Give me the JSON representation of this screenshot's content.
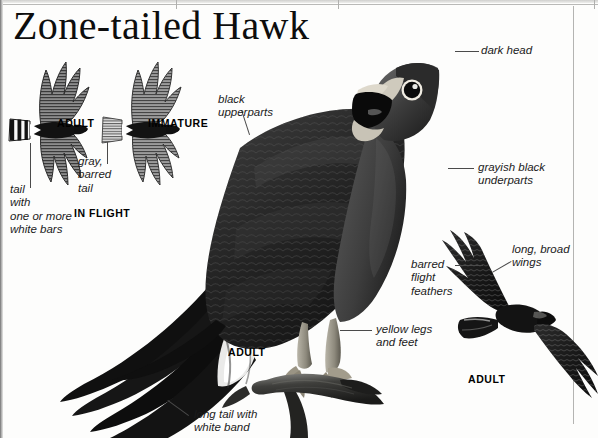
{
  "page": {
    "title": "Zone-tailed Hawk",
    "width": 598,
    "height": 438,
    "background": "#fdfdfc",
    "ink": "#111111"
  },
  "plate": {
    "subject": "Zone-tailed Hawk",
    "figures": [
      {
        "name": "adult-in-flight-silhouette",
        "caption": "ADULT"
      },
      {
        "name": "immature-in-flight-silhouette",
        "caption": "IMMATURE"
      },
      {
        "name": "in-flight-group",
        "caption": "IN FLIGHT"
      },
      {
        "name": "perched-adult",
        "caption": "ADULT"
      },
      {
        "name": "soaring-adult",
        "caption": "ADULT"
      }
    ]
  },
  "captions": {
    "adult_flight": "ADULT",
    "immature_flight": "IMMATURE",
    "in_flight": "IN FLIGHT",
    "perched_adult": "ADULT",
    "soaring_adult": "ADULT"
  },
  "annotations": [
    {
      "id": "tail-white-bars",
      "text": "tail\nwith\none or more\nwhite bars"
    },
    {
      "id": "gray-barred-tail",
      "text": "gray,\nbarred\ntail"
    },
    {
      "id": "black-upperparts",
      "text": "black\nupperparts"
    },
    {
      "id": "dark-head",
      "text": "dark head"
    },
    {
      "id": "grayish-black-underparts",
      "text": "grayish black\nunderparts"
    },
    {
      "id": "barred-flight-feathers",
      "text": "barred\nflight\nfeathers"
    },
    {
      "id": "long-broad-wings",
      "text": "long, broad\nwings"
    },
    {
      "id": "yellow-legs-and-feet",
      "text": "yellow legs\nand feet"
    },
    {
      "id": "long-tail-white-band",
      "text": "long tail with\nwhite band"
    }
  ],
  "colors": {
    "ink": "#111111",
    "leader": "#4a4a4a",
    "rule": "#b4b4b2",
    "plumage_dark": "#141414",
    "plumage_mid": "#4c4c4c",
    "plumage_light": "#9a9a9a",
    "paper": "#fdfdfc"
  }
}
